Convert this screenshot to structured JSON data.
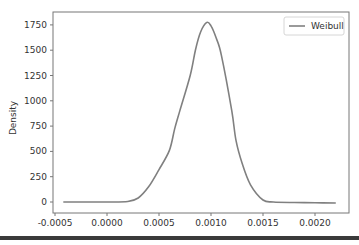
{
  "chart_data": {
    "type": "line",
    "title": "",
    "xlabel": "",
    "ylabel": "Density",
    "xlim": [
      -0.00055,
      0.00235
    ],
    "ylim": [
      -90,
      1860
    ],
    "x_ticks": [
      -0.0005,
      0.0,
      0.0005,
      0.001,
      0.0015,
      0.002
    ],
    "x_tick_labels": [
      "-0.0005",
      "0.0000",
      "0.0005",
      "0.0010",
      "0.0015",
      "0.0020"
    ],
    "y_ticks": [
      0,
      250,
      500,
      750,
      1000,
      1250,
      1500,
      1750
    ],
    "y_tick_labels": [
      "0",
      "250",
      "500",
      "750",
      "1000",
      "1250",
      "1500",
      "1750"
    ],
    "grid": false,
    "legend_position": "upper right",
    "series": [
      {
        "name": "Weibull",
        "color": "#808080",
        "x": [
          -0.00042,
          -0.0002,
          0.0,
          0.0002,
          0.0003,
          0.0004,
          0.0005,
          0.0006,
          0.00065,
          0.0007,
          0.0008,
          0.00085,
          0.0009,
          0.00096,
          0.001,
          0.00105,
          0.0011,
          0.0012,
          0.00124,
          0.0013,
          0.00138,
          0.0015,
          0.0016,
          0.0018,
          0.002,
          0.0022
        ],
        "values": [
          0,
          0,
          0,
          5,
          40,
          150,
          320,
          510,
          720,
          900,
          1250,
          1500,
          1680,
          1775,
          1740,
          1620,
          1450,
          900,
          610,
          380,
          170,
          20,
          0,
          -5,
          -8,
          -10
        ]
      }
    ]
  }
}
